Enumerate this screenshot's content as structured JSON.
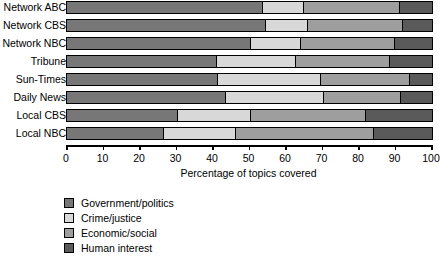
{
  "chart_data": {
    "type": "bar",
    "orientation": "horizontal",
    "stacked": true,
    "title": "",
    "xlabel": "Percentage of topics covered",
    "ylabel": "",
    "xlim": [
      0,
      100
    ],
    "xticks": [
      0,
      10,
      20,
      30,
      40,
      50,
      60,
      70,
      80,
      90,
      100
    ],
    "grid": false,
    "legend_position": "below-left",
    "categories": [
      "Network ABC",
      "Network CBS",
      "Network NBC",
      "Tribune",
      "Sun-Times",
      "Daily News",
      "Local CBS",
      "Local NBC"
    ],
    "series": [
      {
        "name": "Government/politics",
        "color": "#777777",
        "values": [
          53.7,
          54.5,
          50.5,
          41.0,
          41.5,
          43.5,
          30.5,
          26.5
        ]
      },
      {
        "name": "Crime/justice",
        "color": "#d8d8d8",
        "values": [
          11.3,
          11.5,
          13.5,
          21.7,
          28.1,
          27.0,
          20.0,
          19.8
        ]
      },
      {
        "name": "Economic/social",
        "color": "#9e9e9e",
        "values": [
          26.2,
          26.0,
          26.0,
          25.8,
          24.4,
          21.0,
          31.5,
          37.7
        ]
      },
      {
        "name": "Human interest",
        "color": "#5a5a5a",
        "values": [
          8.8,
          8.0,
          10.0,
          11.5,
          6.0,
          8.5,
          18.0,
          16.0
        ]
      }
    ]
  },
  "axis": {
    "tick_labels": [
      "0",
      "10",
      "20",
      "30",
      "40",
      "50",
      "60",
      "70",
      "80",
      "90",
      "100"
    ],
    "x_axis_title": "Percentage of topics covered"
  },
  "legend": {
    "items": [
      {
        "label": "Government/politics",
        "color": "#777777"
      },
      {
        "label": "Crime/justice",
        "color": "#d8d8d8"
      },
      {
        "label": "Economic/social",
        "color": "#9e9e9e"
      },
      {
        "label": "Human interest",
        "color": "#5a5a5a"
      }
    ]
  }
}
